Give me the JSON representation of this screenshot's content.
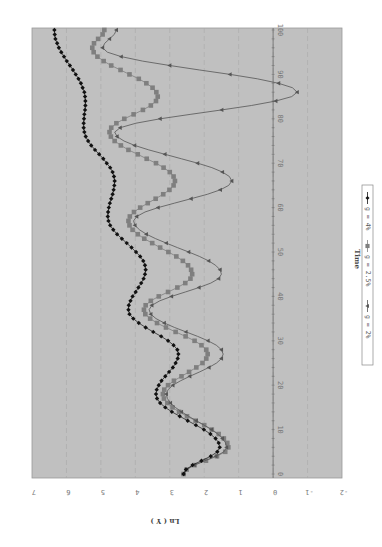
{
  "chart_data": {
    "type": "line",
    "orientation_note_visible": "chart rendered rotated 90 degrees",
    "title": "",
    "xlabel": "Time",
    "ylabel": "Ln ( Y )",
    "xlim": [
      0,
      100
    ],
    "ylim": [
      -2,
      7
    ],
    "x_ticks": [
      "0",
      "10",
      "20",
      "30",
      "40",
      "50",
      "60",
      "70",
      "80",
      "90",
      "100"
    ],
    "y_ticks": [
      "7",
      "6",
      "5",
      "4",
      "3",
      "2",
      "1",
      "0",
      "-1",
      "-2"
    ],
    "grid": true,
    "legend_position": "bottom (rotated: right side)",
    "background_color": "#c0c0c0",
    "x": [
      0,
      1,
      2,
      3,
      4,
      5,
      6,
      7,
      8,
      9,
      10,
      11,
      12,
      13,
      14,
      15,
      16,
      17,
      18,
      19,
      20,
      21,
      22,
      23,
      24,
      25,
      26,
      27,
      28,
      29,
      30,
      31,
      32,
      33,
      34,
      35,
      36,
      37,
      38,
      39,
      40,
      41,
      42,
      43,
      44,
      45,
      46,
      47,
      48,
      49,
      50,
      51,
      52,
      53,
      54,
      55,
      56,
      57,
      58,
      59,
      60,
      61,
      62,
      63,
      64,
      65,
      66,
      67,
      68,
      69,
      70,
      71,
      72,
      73,
      74,
      75,
      76,
      77,
      78,
      79,
      80,
      81,
      82,
      83,
      84,
      85,
      86,
      87,
      88,
      89,
      90,
      91,
      92,
      93,
      94,
      95,
      96,
      97,
      98,
      99,
      100
    ],
    "series": [
      {
        "name": "g = 4%",
        "marker": "diamond",
        "color": "#111111",
        "values": [
          2.6,
          2.53,
          2.34,
          2.08,
          1.81,
          1.62,
          1.55,
          1.58,
          1.67,
          1.82,
          2.01,
          2.24,
          2.48,
          2.71,
          2.94,
          3.13,
          3.28,
          3.37,
          3.4,
          3.38,
          3.32,
          3.24,
          3.13,
          3.02,
          2.91,
          2.83,
          2.77,
          2.75,
          2.78,
          2.89,
          3.05,
          3.25,
          3.48,
          3.7,
          3.9,
          4.06,
          4.17,
          4.2,
          4.19,
          4.14,
          4.08,
          3.99,
          3.91,
          3.83,
          3.76,
          3.72,
          3.7,
          3.72,
          3.77,
          3.86,
          3.98,
          4.11,
          4.25,
          4.39,
          4.53,
          4.64,
          4.73,
          4.78,
          4.8,
          4.79,
          4.77,
          4.74,
          4.7,
          4.66,
          4.63,
          4.61,
          4.6,
          4.62,
          4.66,
          4.73,
          4.83,
          4.93,
          5.05,
          5.17,
          5.28,
          5.37,
          5.44,
          5.48,
          5.5,
          5.5,
          5.49,
          5.48,
          5.46,
          5.45,
          5.45,
          5.46,
          5.48,
          5.53,
          5.58,
          5.65,
          5.73,
          5.81,
          5.9,
          5.99,
          6.07,
          6.15,
          6.22,
          6.27,
          6.32,
          6.34,
          6.35
        ]
      },
      {
        "name": "g = 2.5%",
        "marker": "square",
        "color": "#7f7f7f",
        "values": [
          2.6,
          2.51,
          2.28,
          1.95,
          1.63,
          1.39,
          1.3,
          1.33,
          1.43,
          1.58,
          1.78,
          2.0,
          2.25,
          2.5,
          2.73,
          2.92,
          3.07,
          3.17,
          3.2,
          3.16,
          3.05,
          2.88,
          2.66,
          2.44,
          2.23,
          2.05,
          1.94,
          1.9,
          1.94,
          2.08,
          2.28,
          2.54,
          2.83,
          3.11,
          3.37,
          3.57,
          3.71,
          3.75,
          3.7,
          3.55,
          3.32,
          3.05,
          2.78,
          2.55,
          2.4,
          2.35,
          2.38,
          2.47,
          2.62,
          2.81,
          3.04,
          3.28,
          3.51,
          3.74,
          3.93,
          4.08,
          4.17,
          4.2,
          4.16,
          4.04,
          3.86,
          3.64,
          3.41,
          3.19,
          3.01,
          2.89,
          2.85,
          2.89,
          3.0,
          3.18,
          3.4,
          3.67,
          3.93,
          4.2,
          4.42,
          4.6,
          4.71,
          4.75,
          4.7,
          4.55,
          4.32,
          4.05,
          3.78,
          3.55,
          3.4,
          3.35,
          3.39,
          3.5,
          3.68,
          3.9,
          4.17,
          4.43,
          4.7,
          4.92,
          5.1,
          5.21,
          5.25,
          5.2,
          5.08,
          4.95,
          4.9
        ]
      },
      {
        "name": "g = 2%",
        "marker": "triangle",
        "color": "#555555",
        "values": [
          2.6,
          2.52,
          2.29,
          1.98,
          1.66,
          1.43,
          1.35,
          1.38,
          1.47,
          1.61,
          1.79,
          2.0,
          2.23,
          2.45,
          2.66,
          2.84,
          2.98,
          3.07,
          3.1,
          3.05,
          2.91,
          2.69,
          2.42,
          2.13,
          1.86,
          1.64,
          1.5,
          1.45,
          1.5,
          1.65,
          1.89,
          2.19,
          2.53,
          2.86,
          3.16,
          3.4,
          3.55,
          3.6,
          3.52,
          3.29,
          2.95,
          2.55,
          2.15,
          1.81,
          1.58,
          1.5,
          1.54,
          1.67,
          1.87,
          2.14,
          2.45,
          2.78,
          3.1,
          3.41,
          3.68,
          3.88,
          4.01,
          4.05,
          3.96,
          3.72,
          3.34,
          2.87,
          2.38,
          1.91,
          1.53,
          1.29,
          1.2,
          1.27,
          1.47,
          1.78,
          2.19,
          2.66,
          3.14,
          3.61,
          4.02,
          4.33,
          4.53,
          4.6,
          4.44,
          3.98,
          3.28,
          2.41,
          1.49,
          0.63,
          -0.08,
          -0.54,
          -0.7,
          -0.56,
          -0.16,
          0.46,
          1.25,
          2.13,
          3.0,
          3.79,
          4.41,
          4.81,
          4.95,
          4.89,
          4.75,
          4.61,
          4.55
        ]
      }
    ]
  },
  "legend": {
    "items": [
      {
        "label": "g = 4%",
        "marker": "diamond"
      },
      {
        "label": "g = 2.5%",
        "marker": "square"
      },
      {
        "label": "g = 2%",
        "marker": "triangle"
      }
    ]
  },
  "axes": {
    "time_title": "Time",
    "value_title": "Ln ( Y )"
  }
}
